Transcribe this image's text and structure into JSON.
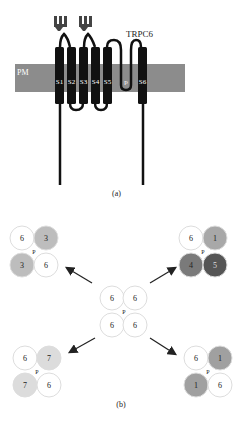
{
  "panel_a": {
    "title": "TRPC6",
    "membrane_label": "PM",
    "caption": "(a)",
    "segments": [
      "S1",
      "S2",
      "S3",
      "S4",
      "S5",
      "p",
      "S6"
    ],
    "membrane_color": "#8c8c8c",
    "segment_color": "#111111"
  },
  "panel_b": {
    "caption": "(b)",
    "pore_label": "P",
    "center": {
      "subunits": [
        "6",
        "6",
        "6",
        "6"
      ],
      "colors": [
        "#ffffff",
        "#ffffff",
        "#ffffff",
        "#ffffff"
      ]
    },
    "top_left": {
      "subunits": [
        "6",
        "3",
        "3",
        "6"
      ],
      "colors": [
        "#ffffff",
        "#bdbdbd",
        "#bdbdbd",
        "#ffffff"
      ]
    },
    "top_right": {
      "subunits": [
        "6",
        "1",
        "4",
        "5"
      ],
      "colors": [
        "#ffffff",
        "#a8a8a8",
        "#7a7a7a",
        "#555555"
      ]
    },
    "bottom_left": {
      "subunits": [
        "6",
        "7",
        "7",
        "6"
      ],
      "colors": [
        "#ffffff",
        "#dcdcdc",
        "#dcdcdc",
        "#ffffff"
      ]
    },
    "bottom_right": {
      "subunits": [
        "6",
        "1",
        "1",
        "6"
      ],
      "colors": [
        "#ffffff",
        "#a0a0a0",
        "#a0a0a0",
        "#ffffff"
      ]
    }
  }
}
